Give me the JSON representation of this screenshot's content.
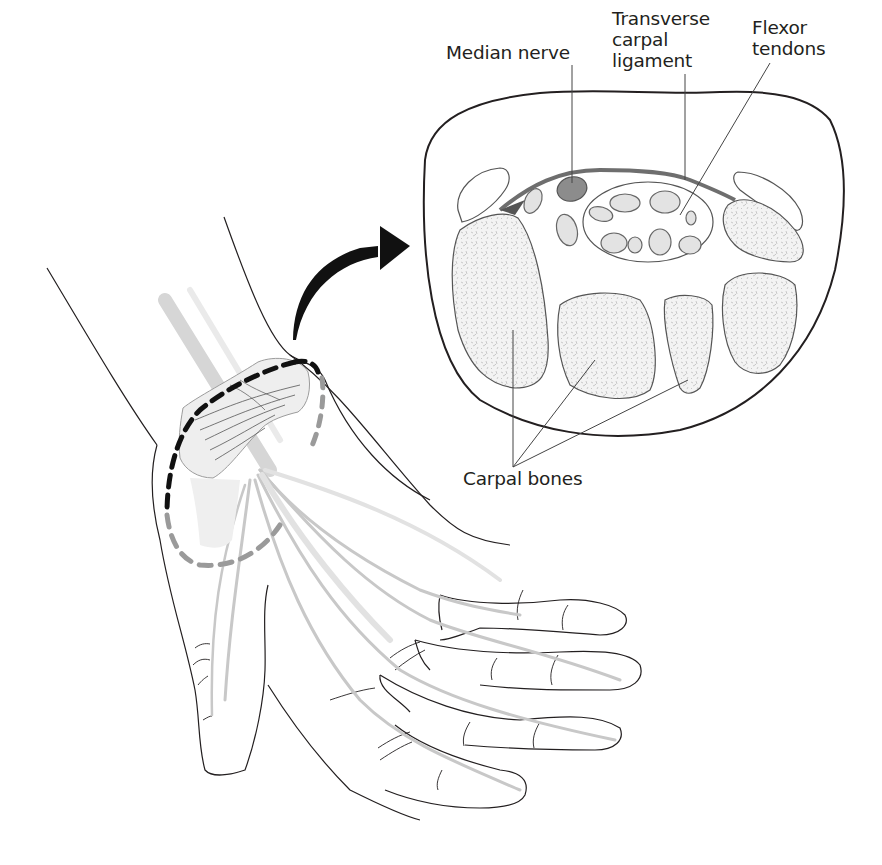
{
  "figure": {
    "type": "anatomical-illustration",
    "labels": {
      "median_nerve": {
        "text": "Median nerve"
      },
      "transverse_carpal_ligament": {
        "lines": [
          "Transverse",
          "carpal",
          "ligament"
        ]
      },
      "flexor_tendons": {
        "lines": [
          "Flexor",
          "tendons"
        ]
      },
      "carpal_bones": {
        "text": "Carpal bones"
      }
    },
    "colors": {
      "outline": "#231f20",
      "nerve_fill": "#8c8c8c",
      "ligament": "#6e6e6e",
      "bone_fill": "#ececec",
      "tendon_fill": "#e3e3e3",
      "dashed_near": "#111111",
      "dashed_far": "#9a9a9a",
      "tendon_stroke": "#c8c8c8"
    }
  }
}
